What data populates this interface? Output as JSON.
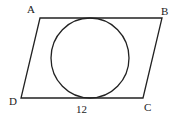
{
  "diagram": {
    "type": "geometry",
    "shape": "parallelogram with inscribed circle",
    "vertices": {
      "A": {
        "label": "A",
        "x": 40,
        "y": 18
      },
      "B": {
        "label": "B",
        "x": 162,
        "y": 18
      },
      "C": {
        "label": "C",
        "x": 143,
        "y": 98
      },
      "D": {
        "label": "D",
        "x": 21,
        "y": 98
      }
    },
    "circle": {
      "cx": 90,
      "cy": 58,
      "r": 40
    },
    "side_label": {
      "text": "12",
      "side": "DC"
    },
    "colors": {
      "stroke": "#222222",
      "background": "#ffffff"
    }
  }
}
